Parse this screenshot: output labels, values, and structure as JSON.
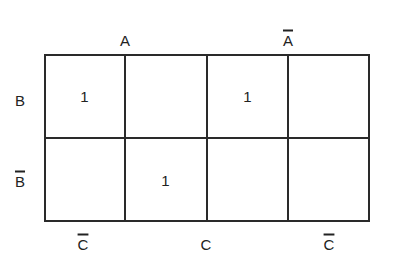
{
  "kmap": {
    "variables": [
      "A",
      "B",
      "C"
    ],
    "top_labels": [
      {
        "text": "A",
        "complement": false
      },
      {
        "text": "A",
        "complement": true
      }
    ],
    "row_labels": [
      {
        "text": "B",
        "complement": false
      },
      {
        "text": "B",
        "complement": true
      }
    ],
    "bottom_labels": [
      {
        "text": "C",
        "complement": true
      },
      {
        "text": "C",
        "complement": false
      },
      {
        "text": "C",
        "complement": true
      }
    ],
    "rows": [
      [
        "1",
        "",
        "1",
        ""
      ],
      [
        "",
        "1",
        "",
        ""
      ]
    ],
    "line_color": "#2a2a2a"
  }
}
